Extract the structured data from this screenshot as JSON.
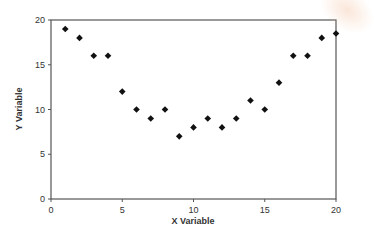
{
  "chart_data": {
    "type": "scatter",
    "title": "",
    "xlabel": "X Variable",
    "ylabel": "Y Variable",
    "xlim": [
      0,
      20
    ],
    "ylim": [
      0,
      20
    ],
    "xticks": [
      0,
      5,
      10,
      15,
      20
    ],
    "yticks": [
      0,
      5,
      10,
      15,
      20
    ],
    "grid": false,
    "legend": null,
    "marker": "diamond",
    "marker_color": "#111111",
    "series": [
      {
        "name": "data",
        "x": [
          1,
          2,
          3,
          4,
          5,
          6,
          7,
          8,
          9,
          10,
          11,
          12,
          13,
          14,
          15,
          16,
          17,
          18,
          19,
          20
        ],
        "y": [
          19,
          18,
          16,
          16,
          12,
          10,
          9,
          10,
          7,
          8,
          9,
          8,
          9,
          11,
          10,
          13,
          16,
          16,
          18,
          18.5
        ]
      }
    ]
  },
  "layout": {
    "plot_left": 51,
    "plot_right": 336,
    "plot_top": 20,
    "plot_bottom": 199,
    "axis_color": "#555555",
    "text_color": "#333333"
  }
}
